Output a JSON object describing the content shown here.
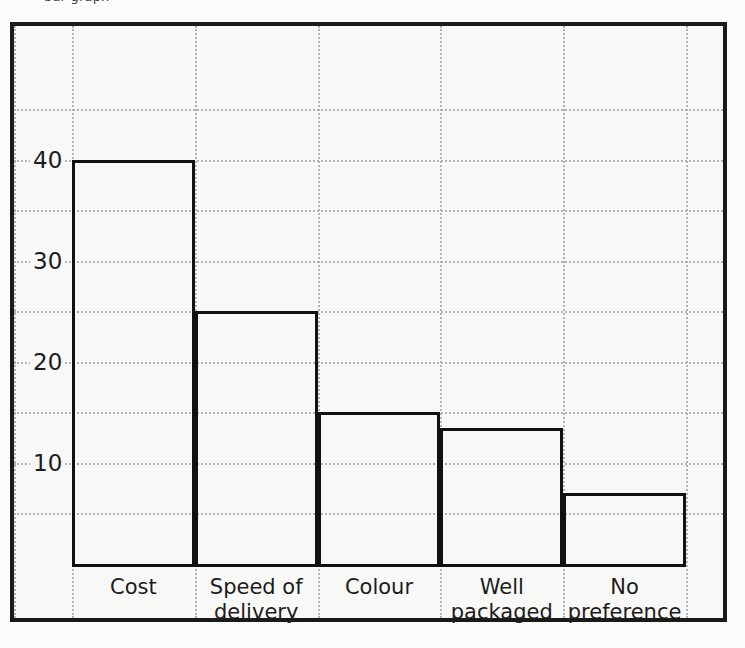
{
  "figure": {
    "caption_remnant": "bar graph",
    "background_color": "#f8f8f6",
    "frame_color": "#1a1a1a",
    "grid_color": "#b3b3b3",
    "bar_outline_color": "#111111"
  },
  "chart_data": {
    "type": "bar",
    "title": "",
    "xlabel": "",
    "ylabel": "",
    "categories": [
      "Cost",
      "Speed of delivery",
      "Colour",
      "Well packaged",
      "No preference"
    ],
    "category_lines": [
      [
        "Cost"
      ],
      [
        "Speed of",
        "delivery"
      ],
      [
        "Colour"
      ],
      [
        "Well",
        "packaged"
      ],
      [
        "No",
        "preference"
      ]
    ],
    "values": [
      40,
      25,
      15,
      13.5,
      7
    ],
    "ylim": [
      0,
      48
    ],
    "ytick_values": [
      10,
      20,
      30,
      40
    ],
    "ytick_labels": [
      "10",
      "20",
      "30",
      "40"
    ],
    "minor_gridline_values": [
      5,
      15,
      25,
      35,
      45
    ],
    "grid": true,
    "legend": "none"
  }
}
